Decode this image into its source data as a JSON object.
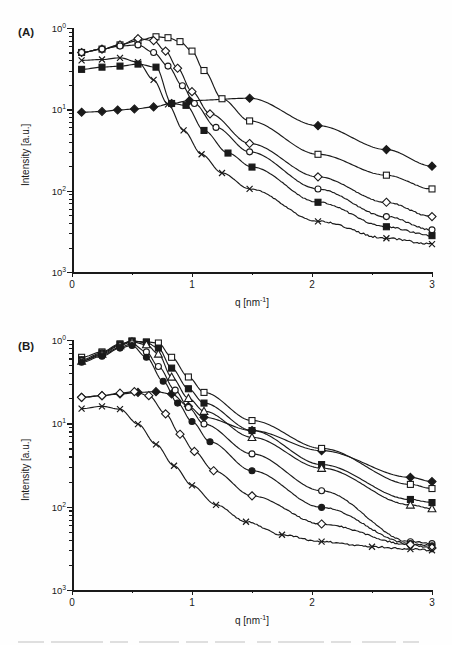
{
  "figure": {
    "panels": [
      {
        "label": "(A)",
        "id": "a"
      },
      {
        "label": "(B)",
        "id": "b"
      }
    ]
  },
  "axes": {
    "xlabel_text": "q [nm",
    "xlabel_sup": "-1",
    "xlabel_tail": "]",
    "ylabel": "Intensity [a.u.]",
    "xticks": [
      "0",
      "1",
      "2",
      "3"
    ],
    "yticks": [
      {
        "mantissa": "10",
        "exp": "0"
      },
      {
        "mantissa": "10",
        "exp": "1"
      },
      {
        "mantissa": "10",
        "exp": "2"
      },
      {
        "mantissa": "10",
        "exp": "3"
      }
    ]
  },
  "chart_data": [
    {
      "type": "line",
      "panel": "(A)",
      "title": "",
      "xlabel": "q [nm^-1]",
      "ylabel": "Intensity [a.u.]",
      "xlim": [
        0,
        3
      ],
      "ylim": [
        0.001,
        1.0
      ],
      "yscale": "log",
      "xscale": "linear",
      "grid": false,
      "legend": "none",
      "xticks": [
        0,
        1,
        2,
        3
      ],
      "yticks": [
        1.0,
        0.1,
        0.01,
        0.001
      ],
      "series": [
        {
          "name": "curve-A1-filled-diamond",
          "marker": "filled-diamond",
          "x": [
            0.08,
            0.25,
            0.38,
            0.52,
            0.68,
            0.83,
            0.98,
            1.48,
            2.05,
            2.62,
            3.0
          ],
          "y": [
            0.092,
            0.094,
            0.098,
            0.101,
            0.107,
            0.118,
            0.128,
            0.137,
            0.063,
            0.032,
            0.02
          ]
        },
        {
          "name": "curve-A2-open-square",
          "marker": "open-square",
          "x": [
            0.08,
            0.25,
            0.4,
            0.55,
            0.7,
            0.8,
            0.9,
            1.0,
            1.1,
            1.25,
            1.48,
            2.05,
            2.62,
            3.0
          ],
          "y": [
            0.5,
            0.55,
            0.62,
            0.7,
            0.78,
            0.76,
            0.68,
            0.52,
            0.3,
            0.135,
            0.072,
            0.028,
            0.0155,
            0.0105
          ]
        },
        {
          "name": "curve-A3-open-diamond",
          "marker": "open-diamond",
          "x": [
            0.08,
            0.25,
            0.4,
            0.55,
            0.68,
            0.78,
            0.88,
            1.0,
            1.15,
            1.48,
            2.05,
            2.62,
            3.0
          ],
          "y": [
            0.5,
            0.55,
            0.62,
            0.74,
            0.7,
            0.52,
            0.32,
            0.165,
            0.088,
            0.038,
            0.0148,
            0.0072,
            0.0048
          ]
        },
        {
          "name": "curve-A4-open-circle-upper",
          "marker": "open-circle",
          "x": [
            0.08,
            0.25,
            0.4,
            0.55,
            0.68,
            0.8,
            0.92,
            1.02,
            1.2,
            1.48,
            2.05,
            2.62,
            3.0
          ],
          "y": [
            0.5,
            0.55,
            0.6,
            0.62,
            0.5,
            0.34,
            0.195,
            0.118,
            0.06,
            0.03,
            0.0105,
            0.0048,
            0.0033
          ]
        },
        {
          "name": "curve-A5-filled-square",
          "marker": "filled-square",
          "x": [
            0.08,
            0.25,
            0.4,
            0.55,
            0.7,
            0.83,
            0.95,
            1.1,
            1.3,
            1.5,
            2.05,
            2.62,
            3.0
          ],
          "y": [
            0.31,
            0.33,
            0.34,
            0.36,
            0.33,
            0.118,
            0.112,
            0.055,
            0.029,
            0.0195,
            0.0072,
            0.0036,
            0.0028
          ]
        },
        {
          "name": "curve-A6-cross",
          "marker": "cross",
          "x": [
            0.08,
            0.25,
            0.4,
            0.55,
            0.68,
            0.8,
            0.93,
            1.08,
            1.25,
            1.48,
            2.05,
            2.62,
            3.0
          ],
          "y": [
            0.4,
            0.41,
            0.43,
            0.38,
            0.23,
            0.115,
            0.055,
            0.028,
            0.0165,
            0.0105,
            0.0042,
            0.0026,
            0.0022
          ]
        }
      ]
    },
    {
      "type": "line",
      "panel": "(B)",
      "title": "",
      "xlabel": "q [nm^-1]",
      "ylabel": "Intensity [a.u.]",
      "xlim": [
        0,
        3
      ],
      "ylim": [
        0.001,
        1.0
      ],
      "yscale": "log",
      "xscale": "linear",
      "grid": false,
      "legend": "none",
      "xticks": [
        0,
        1,
        2,
        3
      ],
      "yticks": [
        1.0,
        0.1,
        0.01,
        0.001
      ],
      "series": [
        {
          "name": "curve-B1-filled-diamond",
          "marker": "filled-diamond",
          "x": [
            0.08,
            0.25,
            0.4,
            0.55,
            0.7,
            0.83,
            0.97,
            1.1,
            1.5,
            2.08,
            2.82,
            3.0
          ],
          "y": [
            0.205,
            0.215,
            0.225,
            0.235,
            0.24,
            0.225,
            0.16,
            0.118,
            0.082,
            0.047,
            0.0225,
            0.02
          ]
        },
        {
          "name": "curve-B2-open-square",
          "marker": "open-square",
          "x": [
            0.08,
            0.25,
            0.4,
            0.5,
            0.62,
            0.72,
            0.83,
            0.97,
            1.1,
            1.5,
            2.08,
            2.82,
            3.0
          ],
          "y": [
            0.62,
            0.72,
            0.9,
            0.97,
            0.95,
            0.92,
            0.62,
            0.36,
            0.235,
            0.108,
            0.05,
            0.0185,
            0.0165
          ]
        },
        {
          "name": "curve-B3-filled-square",
          "marker": "filled-square",
          "x": [
            0.08,
            0.25,
            0.4,
            0.5,
            0.62,
            0.72,
            0.83,
            0.97,
            1.1,
            1.5,
            2.08,
            2.82,
            3.0
          ],
          "y": [
            0.58,
            0.7,
            0.88,
            0.97,
            0.93,
            0.8,
            0.46,
            0.26,
            0.175,
            0.082,
            0.032,
            0.0122,
            0.0112
          ]
        },
        {
          "name": "curve-B4-open-triangle",
          "marker": "open-triangle",
          "x": [
            0.08,
            0.25,
            0.4,
            0.5,
            0.62,
            0.72,
            0.83,
            0.97,
            1.1,
            1.5,
            2.08,
            2.82,
            3.0
          ],
          "y": [
            0.56,
            0.68,
            0.86,
            0.95,
            0.88,
            0.68,
            0.36,
            0.2,
            0.14,
            0.068,
            0.029,
            0.0105,
            0.0095
          ]
        },
        {
          "name": "curve-B5-open-circle",
          "marker": "open-circle",
          "x": [
            0.08,
            0.25,
            0.4,
            0.5,
            0.62,
            0.72,
            0.86,
            0.97,
            1.1,
            1.5,
            2.08,
            2.82,
            3.0
          ],
          "y": [
            0.56,
            0.66,
            0.82,
            0.9,
            0.72,
            0.48,
            0.25,
            0.155,
            0.098,
            0.043,
            0.0155,
            0.0038,
            0.0036
          ]
        },
        {
          "name": "curve-B6-filled-circle",
          "marker": "filled-circle",
          "x": [
            0.08,
            0.25,
            0.4,
            0.5,
            0.62,
            0.76,
            0.88,
            1.0,
            1.15,
            1.5,
            2.08,
            2.82,
            3.0
          ],
          "y": [
            0.54,
            0.64,
            0.8,
            0.86,
            0.62,
            0.32,
            0.175,
            0.105,
            0.06,
            0.027,
            0.0098,
            0.0036,
            0.0034
          ]
        },
        {
          "name": "curve-B7-open-diamond",
          "marker": "open-diamond",
          "x": [
            0.08,
            0.25,
            0.4,
            0.52,
            0.64,
            0.78,
            0.9,
            1.02,
            1.18,
            1.5,
            2.08,
            2.82,
            3.0
          ],
          "y": [
            0.205,
            0.215,
            0.23,
            0.24,
            0.215,
            0.13,
            0.074,
            0.046,
            0.027,
            0.0135,
            0.0062,
            0.0035,
            0.0032
          ]
        },
        {
          "name": "curve-B8-cross",
          "marker": "cross",
          "x": [
            0.08,
            0.25,
            0.4,
            0.55,
            0.7,
            0.85,
            1.0,
            1.2,
            1.45,
            1.75,
            2.08,
            2.5,
            2.82,
            3.0
          ],
          "y": [
            0.15,
            0.16,
            0.148,
            0.098,
            0.056,
            0.031,
            0.018,
            0.0105,
            0.0066,
            0.0046,
            0.0038,
            0.0033,
            0.0031,
            0.003
          ]
        }
      ]
    }
  ]
}
